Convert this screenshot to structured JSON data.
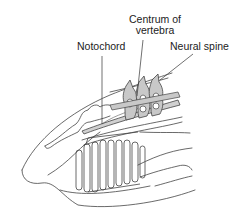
{
  "figure": {
    "labels": {
      "centrum_line1": "Centrum of",
      "centrum_line2": "vertebra",
      "notochord": "Notochord",
      "neural_spine": "Neural spine"
    },
    "colors": {
      "line": "#333333",
      "fill_bone": "#c8c8c8",
      "fill_notochord": "#d4d4d4",
      "background": "#ffffff"
    }
  }
}
